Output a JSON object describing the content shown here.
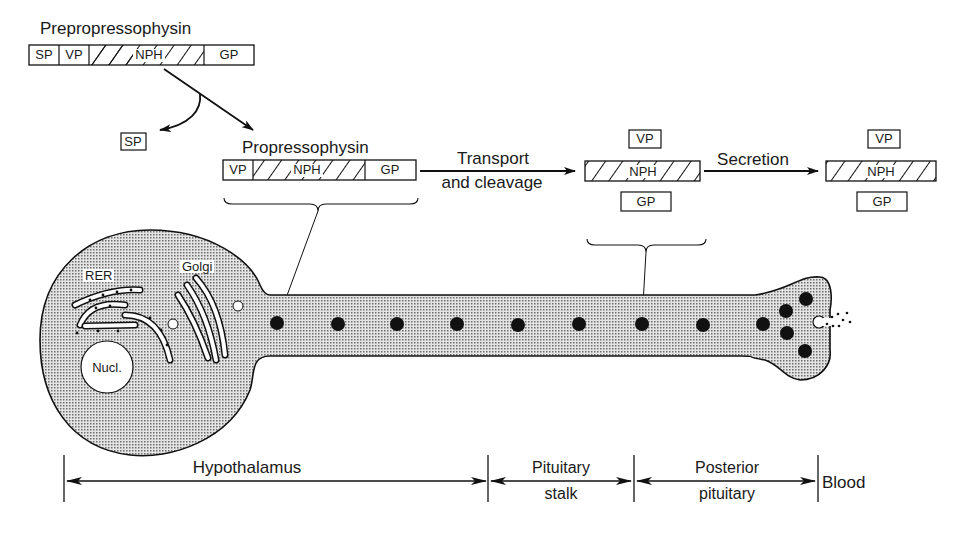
{
  "diagram": {
    "prepro": {
      "title": "Prepropressophysin",
      "segments": [
        "SP",
        "VP",
        "NPH",
        "GP"
      ]
    },
    "signal_peptide_label": "SP",
    "pro": {
      "title": "Propressophysin",
      "segments": [
        "VP",
        "NPH",
        "GP"
      ]
    },
    "transport_arrow": {
      "line1": "Transport",
      "line2": "and cleavage"
    },
    "cleaved": {
      "vp": "VP",
      "nph": "NPH",
      "gp": "GP"
    },
    "secretion_arrow": {
      "label": "Secretion"
    },
    "secreted": {
      "vp": "VP",
      "nph": "NPH",
      "gp": "GP"
    },
    "neuron": {
      "rer_label": "RER",
      "golgi_label": "Golgi",
      "nucleus_label": "Nucl.",
      "granule_count": 13
    },
    "regions": [
      {
        "line1": "Hypothalamus",
        "line2": ""
      },
      {
        "line1": "Pituitary",
        "line2": "stalk"
      },
      {
        "line1": "Posterior",
        "line2": "pituitary"
      },
      {
        "line1": "Blood",
        "line2": ""
      }
    ],
    "colors": {
      "ink": "#111111",
      "stipple": "#9a9a9a",
      "background": "#ffffff"
    }
  }
}
